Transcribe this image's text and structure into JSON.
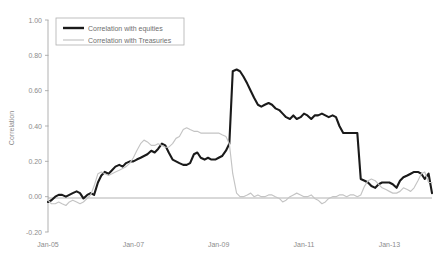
{
  "chart_data": {
    "type": "line",
    "title": "",
    "xlabel": "",
    "ylabel": "Correlation",
    "ylim": [
      -0.2,
      1.0
    ],
    "yticks": [
      "1.00",
      "0.80",
      "0.60",
      "0.40",
      "0.20",
      "0.00",
      "-0.20"
    ],
    "ytick_values": [
      1.0,
      0.8,
      0.6,
      0.4,
      0.2,
      0.0,
      -0.2
    ],
    "xticks": [
      "Jan-05",
      "Jan-07",
      "Jan-09",
      "Jan-11",
      "Jan-13"
    ],
    "xtick_values": [
      2005.0,
      2007.0,
      2009.0,
      2011.0,
      2013.0
    ],
    "xlim": [
      2005.0,
      2014.0
    ],
    "grid": false,
    "zero_line": true,
    "legend_position": "top-left",
    "colors": {
      "equities": "#1a1a1a",
      "treasuries": "#c4c4c4",
      "axis": "#a8a8a8",
      "text": "#8c8c8c",
      "background": "#ffffff"
    },
    "series": [
      {
        "name": "Correlation with equities",
        "color": "#1a1a1a",
        "x": [
          2005.0,
          2005.08,
          2005.17,
          2005.25,
          2005.33,
          2005.42,
          2005.5,
          2005.58,
          2005.67,
          2005.75,
          2005.83,
          2005.92,
          2006.0,
          2006.08,
          2006.17,
          2006.25,
          2006.33,
          2006.42,
          2006.5,
          2006.58,
          2006.67,
          2006.75,
          2006.83,
          2006.92,
          2007.0,
          2007.08,
          2007.17,
          2007.25,
          2007.33,
          2007.42,
          2007.5,
          2007.58,
          2007.67,
          2007.75,
          2007.83,
          2007.92,
          2008.0,
          2008.08,
          2008.17,
          2008.25,
          2008.33,
          2008.42,
          2008.5,
          2008.58,
          2008.67,
          2008.75,
          2008.83,
          2008.92,
          2009.0,
          2009.08,
          2009.17,
          2009.25,
          2009.33,
          2009.42,
          2009.5,
          2009.58,
          2009.67,
          2009.75,
          2009.83,
          2009.92,
          2010.0,
          2010.08,
          2010.17,
          2010.25,
          2010.33,
          2010.42,
          2010.5,
          2010.58,
          2010.67,
          2010.75,
          2010.83,
          2010.92,
          2011.0,
          2011.08,
          2011.17,
          2011.25,
          2011.33,
          2011.42,
          2011.5,
          2011.58,
          2011.67,
          2011.75,
          2011.83,
          2011.92,
          2012.0,
          2012.08,
          2012.17,
          2012.25,
          2012.33,
          2012.42,
          2012.5,
          2012.58,
          2012.67,
          2012.75,
          2012.83,
          2012.92,
          2013.0,
          2013.08,
          2013.17,
          2013.25,
          2013.33,
          2013.42,
          2013.5,
          2013.58,
          2013.67,
          2013.75,
          2013.83,
          2013.92,
          2014.0
        ],
        "values": [
          -0.03,
          -0.02,
          0.0,
          0.01,
          0.01,
          0.0,
          0.01,
          0.02,
          0.03,
          0.02,
          -0.01,
          0.01,
          0.02,
          0.01,
          0.08,
          0.12,
          0.14,
          0.13,
          0.15,
          0.17,
          0.18,
          0.17,
          0.19,
          0.2,
          0.2,
          0.21,
          0.22,
          0.23,
          0.24,
          0.26,
          0.25,
          0.27,
          0.3,
          0.29,
          0.25,
          0.21,
          0.2,
          0.19,
          0.18,
          0.18,
          0.19,
          0.24,
          0.25,
          0.22,
          0.21,
          0.22,
          0.21,
          0.21,
          0.22,
          0.23,
          0.26,
          0.3,
          0.71,
          0.72,
          0.71,
          0.68,
          0.64,
          0.6,
          0.56,
          0.52,
          0.51,
          0.52,
          0.53,
          0.52,
          0.5,
          0.49,
          0.47,
          0.45,
          0.44,
          0.46,
          0.44,
          0.45,
          0.47,
          0.46,
          0.44,
          0.46,
          0.46,
          0.47,
          0.46,
          0.45,
          0.46,
          0.45,
          0.4,
          0.36,
          0.36,
          0.36,
          0.36,
          0.36,
          0.1,
          0.09,
          0.08,
          0.06,
          0.05,
          0.07,
          0.08,
          0.08,
          0.08,
          0.07,
          0.05,
          0.09,
          0.11,
          0.12,
          0.13,
          0.14,
          0.14,
          0.13,
          0.1,
          0.13,
          0.02
        ]
      },
      {
        "name": "Correlation with Treasuries",
        "color": "#c4c4c4",
        "x": [
          2005.0,
          2005.08,
          2005.17,
          2005.25,
          2005.33,
          2005.42,
          2005.5,
          2005.58,
          2005.67,
          2005.75,
          2005.83,
          2005.92,
          2006.0,
          2006.08,
          2006.17,
          2006.25,
          2006.33,
          2006.42,
          2006.5,
          2006.58,
          2006.67,
          2006.75,
          2006.83,
          2006.92,
          2007.0,
          2007.08,
          2007.17,
          2007.25,
          2007.33,
          2007.42,
          2007.5,
          2007.58,
          2007.67,
          2007.75,
          2007.83,
          2007.92,
          2008.0,
          2008.08,
          2008.17,
          2008.25,
          2008.33,
          2008.42,
          2008.5,
          2008.58,
          2008.67,
          2008.75,
          2008.83,
          2008.92,
          2009.0,
          2009.08,
          2009.17,
          2009.25,
          2009.33,
          2009.42,
          2009.5,
          2009.58,
          2009.67,
          2009.75,
          2009.83,
          2009.92,
          2010.0,
          2010.08,
          2010.17,
          2010.25,
          2010.33,
          2010.42,
          2010.5,
          2010.58,
          2010.67,
          2010.75,
          2010.83,
          2010.92,
          2011.0,
          2011.08,
          2011.17,
          2011.25,
          2011.33,
          2011.42,
          2011.5,
          2011.58,
          2011.67,
          2011.75,
          2011.83,
          2011.92,
          2012.0,
          2012.08,
          2012.17,
          2012.25,
          2012.33,
          2012.42,
          2012.5,
          2012.58,
          2012.67,
          2012.75,
          2012.83,
          2012.92,
          2013.0,
          2013.08,
          2013.17,
          2013.25,
          2013.33,
          2013.42,
          2013.5,
          2013.58,
          2013.67,
          2013.75,
          2013.83,
          2013.92,
          2014.0
        ],
        "values": [
          -0.02,
          -0.04,
          -0.04,
          -0.03,
          -0.04,
          -0.05,
          -0.03,
          -0.02,
          -0.03,
          -0.04,
          -0.03,
          -0.01,
          0.01,
          0.06,
          0.13,
          0.14,
          0.13,
          0.12,
          0.13,
          0.14,
          0.15,
          0.16,
          0.17,
          0.19,
          0.22,
          0.26,
          0.3,
          0.32,
          0.31,
          0.29,
          0.29,
          0.3,
          0.29,
          0.28,
          0.28,
          0.3,
          0.33,
          0.34,
          0.38,
          0.39,
          0.38,
          0.37,
          0.37,
          0.36,
          0.36,
          0.36,
          0.36,
          0.36,
          0.36,
          0.35,
          0.34,
          0.3,
          0.13,
          0.02,
          0.0,
          0.0,
          0.01,
          0.02,
          0.0,
          0.01,
          0.0,
          0.0,
          0.01,
          0.01,
          0.0,
          -0.01,
          -0.03,
          -0.02,
          0.0,
          0.01,
          0.02,
          0.01,
          0.0,
          0.0,
          0.01,
          -0.01,
          -0.02,
          -0.04,
          -0.03,
          -0.01,
          0.0,
          0.0,
          0.01,
          0.01,
          0.0,
          0.01,
          0.01,
          0.0,
          0.01,
          0.06,
          0.09,
          0.1,
          0.09,
          0.07,
          0.05,
          0.04,
          0.03,
          0.02,
          0.02,
          0.03,
          0.05,
          0.04,
          0.03,
          0.05,
          0.09,
          0.13,
          0.14,
          0.08,
          0.08
        ]
      }
    ]
  },
  "legend": {
    "items": [
      {
        "label": "Correlation with equities",
        "color": "#1a1a1a",
        "width": 2.4
      },
      {
        "label": "Correlation with Treasuries",
        "color": "#c4c4c4",
        "width": 1.2
      }
    ]
  }
}
